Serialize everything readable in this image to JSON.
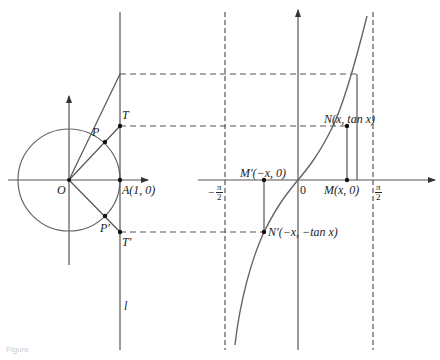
{
  "figure": {
    "caption": "Figure",
    "colors": {
      "stroke": "#555555",
      "text": "#222222",
      "background": "#ffffff"
    }
  },
  "left_panel": {
    "origin_label": "O",
    "point_P": "P",
    "point_P_prime": "P′",
    "point_T": "T",
    "point_T_prime": "T′",
    "point_A": "A(1, 0)",
    "tangent_line_label": "l"
  },
  "right_panel": {
    "origin_label": "0",
    "neg_half_pi": {
      "sign": "−",
      "num": "π",
      "den": "2"
    },
    "pos_half_pi": {
      "num": "π",
      "den": "2"
    },
    "point_M": "M(x, 0)",
    "point_M_prime": "M′(−x, 0)",
    "point_N": "N(x, tan x)",
    "point_N_prime": "N′(−x, −tan x)"
  }
}
